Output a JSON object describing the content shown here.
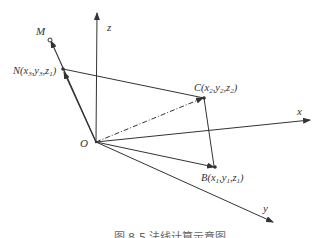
{
  "diagram": {
    "axes": {
      "x_label": "x",
      "y_label": "y",
      "z_label": "z",
      "origin_label": "O"
    },
    "points": {
      "M": {
        "label": "M"
      },
      "N": {
        "label": "N(x",
        "sub1": "3",
        "mid1": ",y",
        "sub2": "3",
        "mid2": ",z",
        "sub3": "1",
        "end": ")"
      },
      "C": {
        "label": "C(x",
        "sub1": "2",
        "mid1": ",y",
        "sub2": "2",
        "mid2": ",z",
        "sub3": "2",
        "end": ")"
      },
      "B": {
        "label": "B(x",
        "sub1": "1",
        "mid1": ",y",
        "sub2": "1",
        "mid2": ",z",
        "sub3": "1",
        "end": ")"
      }
    },
    "caption": "图 8-5  法线计算示意图"
  },
  "colors": {
    "line": "#333333",
    "text": "#333333",
    "caption": "#777777"
  }
}
